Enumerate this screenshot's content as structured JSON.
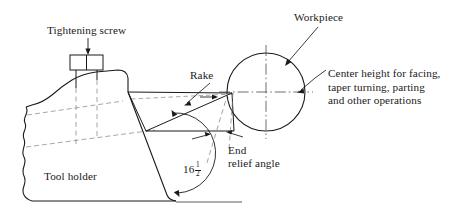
{
  "figure": {
    "background_color": "#ffffff",
    "line_color": "#1a1a1a",
    "dashed_color": "#8a8a8a"
  },
  "labels": {
    "tightening_screw": "Tightening screw",
    "workpiece": "Workpiece",
    "rake": "Rake",
    "tool_holder": "Tool holder",
    "center_height_line1": "Center height for facing,",
    "center_height_line2": "taper turning, parting",
    "center_height_line3": "and other operations",
    "end_relief_line1": "End",
    "end_relief_line2": "relief angle",
    "angle_whole": "16",
    "angle_numerator": "1",
    "angle_denominator": "2"
  },
  "icons": {
    "tightening_screw_arrow": "down-arrow-icon",
    "workpiece_arrow": "diagonal-arrow-icon",
    "rake_arrow": "diagonal-arrow-icon",
    "center_height_arrow": "left-arrow-icon",
    "end_relief_arrows": "double-arrow-icon",
    "angle_arc": "arc-icon",
    "break_line": "wavy-break-line-icon",
    "center_mark": "center-dash-dot-icon"
  }
}
